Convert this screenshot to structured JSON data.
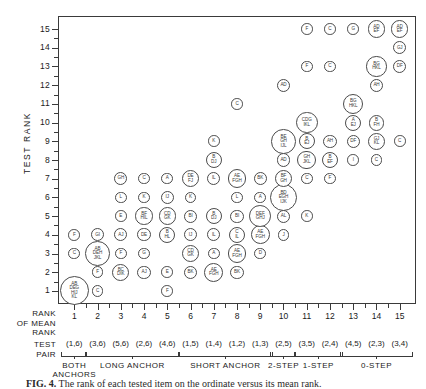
{
  "chart_data": {
    "type": "scatter",
    "title": "",
    "ylabel": "TEST RANK",
    "xlabel": "RANK OF MEAN RANK",
    "xlim": [
      0.3,
      15.7
    ],
    "ylim": [
      0.3,
      15.7
    ],
    "grid": false,
    "legend": "none",
    "yticks": [
      1,
      2,
      3,
      4,
      5,
      6,
      7,
      8,
      9,
      10,
      11,
      12,
      13,
      14,
      15
    ],
    "xticks": [
      1,
      2,
      3,
      4,
      5,
      6,
      7,
      8,
      9,
      10,
      11,
      12,
      13,
      14,
      15
    ],
    "test_pairs": [
      "(1,6)",
      "(3,6)",
      "(5,6)",
      "(2,6)",
      "(4,6)",
      "(1,5)",
      "(1,4)",
      "(1,2)",
      "(1,3)",
      "(2,5)",
      "(3,5)",
      "(2,4)",
      "(4,5)",
      "(2,3)",
      "(3,4)"
    ],
    "groups": [
      {
        "label": "BOTH ANCHORS",
        "from": 1,
        "to": 1
      },
      {
        "label": "LONG ANCHOR",
        "from": 2,
        "to": 5
      },
      {
        "label": "SHORT ANCHOR",
        "from": 6,
        "to": 9
      },
      {
        "label": "2-STEP",
        "from": 10,
        "to": 10
      },
      {
        "label": "1-STEP",
        "from": 11,
        "to": 12
      },
      {
        "label": "0-STEP",
        "from": 13,
        "to": 15
      }
    ],
    "points": [
      {
        "x": 1,
        "y": 1,
        "label": "AB\nDEG\nHIJ\nKL",
        "size": 20
      },
      {
        "x": 1,
        "y": 3,
        "label": "C",
        "size": 8
      },
      {
        "x": 1,
        "y": 4,
        "label": "F",
        "size": 8
      },
      {
        "x": 2,
        "y": 1,
        "label": "C",
        "size": 8
      },
      {
        "x": 2,
        "y": 2,
        "label": "F",
        "size": 8
      },
      {
        "x": 2,
        "y": 3,
        "label": "AB\nDEH\nJKL",
        "size": 17
      },
      {
        "x": 2,
        "y": 4,
        "label": "GI",
        "size": 9
      },
      {
        "x": 3,
        "y": 2,
        "label": "BC\nDIK",
        "size": 12
      },
      {
        "x": 3,
        "y": 3,
        "label": "F",
        "size": 8
      },
      {
        "x": 3,
        "y": 4,
        "label": "AJ",
        "size": 9
      },
      {
        "x": 3,
        "y": 5,
        "label": "E",
        "size": 8
      },
      {
        "x": 3,
        "y": 6,
        "label": "L",
        "size": 8
      },
      {
        "x": 3,
        "y": 7,
        "label": "GH",
        "size": 9
      },
      {
        "x": 4,
        "y": 2,
        "label": "AJ",
        "size": 9
      },
      {
        "x": 4,
        "y": 3,
        "label": "G",
        "size": 8
      },
      {
        "x": 4,
        "y": 4,
        "label": "DE",
        "size": 9
      },
      {
        "x": 4,
        "y": 5,
        "label": "BF\nHIL",
        "size": 12
      },
      {
        "x": 4,
        "y": 6,
        "label": "K",
        "size": 8
      },
      {
        "x": 4,
        "y": 7,
        "label": "C",
        "size": 8
      },
      {
        "x": 5,
        "y": 1,
        "label": "F",
        "size": 8
      },
      {
        "x": 5,
        "y": 2,
        "label": "E",
        "size": 8
      },
      {
        "x": 5,
        "y": 4,
        "label": "B\nHL",
        "size": 11
      },
      {
        "x": 5,
        "y": 5,
        "label": "CD\nGK",
        "size": 12
      },
      {
        "x": 5,
        "y": 6,
        "label": "IJ",
        "size": 9
      },
      {
        "x": 5,
        "y": 7,
        "label": "A",
        "size": 8
      },
      {
        "x": 6,
        "y": 2,
        "label": "BK",
        "size": 9
      },
      {
        "x": 6,
        "y": 3,
        "label": "CD\nGK",
        "size": 12
      },
      {
        "x": 6,
        "y": 4,
        "label": "IJ",
        "size": 9
      },
      {
        "x": 6,
        "y": 5,
        "label": "BI",
        "size": 9
      },
      {
        "x": 6,
        "y": 6,
        "label": "K",
        "size": 8
      },
      {
        "x": 6,
        "y": 7,
        "label": "DE\nFJ",
        "size": 12
      },
      {
        "x": 7,
        "y": 2,
        "label": "AE\nFGH",
        "size": 13
      },
      {
        "x": 7,
        "y": 3,
        "label": "A",
        "size": 8
      },
      {
        "x": 7,
        "y": 4,
        "label": "IL",
        "size": 9
      },
      {
        "x": 7,
        "y": 5,
        "label": "B\nDJ",
        "size": 11
      },
      {
        "x": 7,
        "y": 7,
        "label": "IL",
        "size": 9
      },
      {
        "x": 7,
        "y": 8,
        "label": "B\nDJ",
        "size": 11
      },
      {
        "x": 7,
        "y": 9,
        "label": "K",
        "size": 8
      },
      {
        "x": 8,
        "y": 2,
        "label": "BK",
        "size": 9
      },
      {
        "x": 8,
        "y": 3,
        "label": "AE\nFGH",
        "size": 13
      },
      {
        "x": 8,
        "y": 4,
        "label": "C\nIL",
        "size": 11
      },
      {
        "x": 8,
        "y": 5,
        "label": "BI",
        "size": 9
      },
      {
        "x": 8,
        "y": 6,
        "label": "L",
        "size": 8
      },
      {
        "x": 8,
        "y": 7,
        "label": "AE\nFGH",
        "size": 13
      },
      {
        "x": 8,
        "y": 11,
        "label": "C",
        "size": 8
      },
      {
        "x": 9,
        "y": 3,
        "label": "D",
        "size": 8
      },
      {
        "x": 9,
        "y": 4,
        "label": "AE\nFGH",
        "size": 13
      },
      {
        "x": 9,
        "y": 5,
        "label": "DEF\nGHJ",
        "size": 15
      },
      {
        "x": 9,
        "y": 6,
        "label": "A",
        "size": 8
      },
      {
        "x": 9,
        "y": 7,
        "label": "BK",
        "size": 9
      },
      {
        "x": 10,
        "y": 4,
        "label": "J",
        "size": 8
      },
      {
        "x": 10,
        "y": 5,
        "label": "AL",
        "size": 9
      },
      {
        "x": 10,
        "y": 6,
        "label": "BD\nEGH\nIJK",
        "size": 19
      },
      {
        "x": 10,
        "y": 7,
        "label": "BF\nGH",
        "size": 12
      },
      {
        "x": 10,
        "y": 8,
        "label": "AD",
        "size": 9
      },
      {
        "x": 10,
        "y": 9,
        "label": "BE\nGH\nIJL",
        "size": 17
      },
      {
        "x": 10,
        "y": 12,
        "label": "AD",
        "size": 9
      },
      {
        "x": 11,
        "y": 5,
        "label": "K",
        "size": 8
      },
      {
        "x": 11,
        "y": 7,
        "label": "C",
        "size": 8
      },
      {
        "x": 11,
        "y": 8,
        "label": "GH\nJKL",
        "size": 13
      },
      {
        "x": 11,
        "y": 9,
        "label": "B\nEJ",
        "size": 11
      },
      {
        "x": 11,
        "y": 10,
        "label": "CDG\nIKL",
        "size": 15
      },
      {
        "x": 11,
        "y": 13,
        "label": "F",
        "size": 8
      },
      {
        "x": 11,
        "y": 15,
        "label": "F",
        "size": 8
      },
      {
        "x": 12,
        "y": 7,
        "label": "F",
        "size": 8
      },
      {
        "x": 12,
        "y": 8,
        "label": "B\nEF",
        "size": 11
      },
      {
        "x": 12,
        "y": 9,
        "label": "AH",
        "size": 9
      },
      {
        "x": 12,
        "y": 13,
        "label": "C",
        "size": 8
      },
      {
        "x": 12,
        "y": 15,
        "label": "C",
        "size": 8
      },
      {
        "x": 13,
        "y": 8,
        "label": "I",
        "size": 8
      },
      {
        "x": 13,
        "y": 9,
        "label": "DF",
        "size": 9
      },
      {
        "x": 13,
        "y": 10,
        "label": "A\nEJ",
        "size": 11
      },
      {
        "x": 13,
        "y": 11,
        "label": "BG\nHKL",
        "size": 14
      },
      {
        "x": 13,
        "y": 15,
        "label": "G",
        "size": 8
      },
      {
        "x": 14,
        "y": 8,
        "label": "C",
        "size": 8
      },
      {
        "x": 14,
        "y": 9,
        "label": "GJ\nKL",
        "size": 12
      },
      {
        "x": 14,
        "y": 10,
        "label": "B\nFH",
        "size": 11
      },
      {
        "x": 14,
        "y": 12,
        "label": "AH",
        "size": 9
      },
      {
        "x": 14,
        "y": 13,
        "label": "BG\nHKL",
        "size": 14
      },
      {
        "x": 14,
        "y": 15,
        "label": "AD\nEF",
        "size": 12
      },
      {
        "x": 15,
        "y": 9,
        "label": "C",
        "size": 8
      },
      {
        "x": 15,
        "y": 13,
        "label": "DF",
        "size": 9
      },
      {
        "x": 15,
        "y": 14,
        "label": "GJ",
        "size": 9
      },
      {
        "x": 15,
        "y": 15,
        "label": "AD\nEF",
        "size": 12
      }
    ]
  },
  "labels": {
    "y_axis_title": "TEST RANK",
    "x_axis_title_lines": [
      "RANK",
      "OF MEAN",
      "RANK"
    ],
    "test_pair_lines": [
      "TEST",
      "PAIR"
    ]
  },
  "caption": {
    "figure_no": "FIG. 4.",
    "text": "The rank of each tested item on the ordinate versus its mean rank."
  }
}
